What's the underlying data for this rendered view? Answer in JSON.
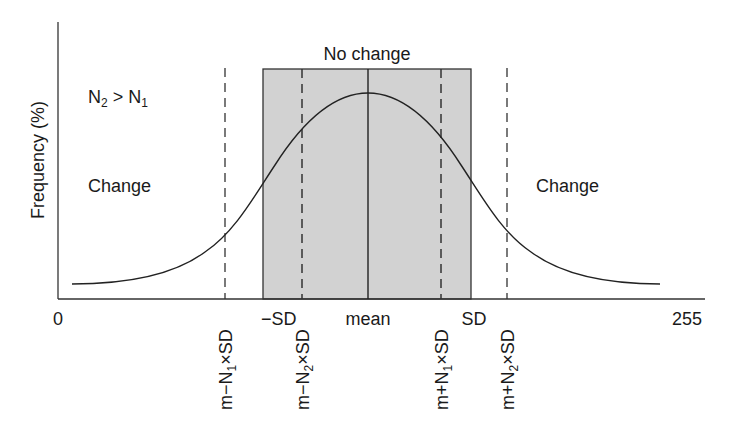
{
  "diagram": {
    "type": "threshold-change-detection",
    "y_axis_label": "Frequency (%)",
    "x_axis": {
      "min_label": "0",
      "max_label": "255"
    },
    "condition_label": {
      "n": "N",
      "sub2": "2",
      "gt": " > ",
      "sub1": "1"
    },
    "regions": {
      "no_change": "No change",
      "change_left": "Change",
      "change_right": "Change"
    },
    "markers": {
      "minus_sd": "−SD",
      "mean": "mean",
      "plus_sd": "SD",
      "m_minus_n1_sd": "m−N₁×SD",
      "m_minus_n2_sd": "m−N₂×SD",
      "m_plus_n1_sd": "m+N₁×SD",
      "m_plus_n2_sd": "m+N₂×SD"
    },
    "colors": {
      "shade": "#d2d2d2",
      "line": "#222222"
    }
  }
}
